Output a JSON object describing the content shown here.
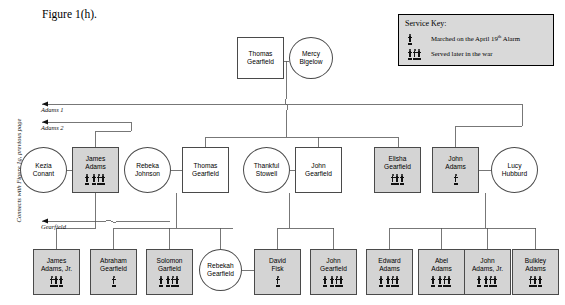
{
  "figure": {
    "caption": "Figure 1(h)."
  },
  "side_note": "Connects with Figure 1g, previous page",
  "service_key": {
    "title": "Service Key:",
    "entries": [
      {
        "icon": "single-soldier-icon",
        "label_prefix": "Marched on the April 19",
        "label_sup": "th",
        "label_suffix": " Alarm"
      },
      {
        "icon": "triple-soldier-icon",
        "label": "Served later in the war"
      }
    ]
  },
  "arrow_labels": [
    {
      "id": "adams1",
      "text": "Adams 1"
    },
    {
      "id": "adams2",
      "text": "Adams 2"
    },
    {
      "id": "gearfield",
      "text": "Gearfield"
    }
  ],
  "generations": {
    "gen1": [
      {
        "id": "thomas-gearfield-sr",
        "name": "Thomas\nGearfield",
        "sex": "male",
        "shaded": false,
        "service": []
      },
      {
        "id": "mercy-bigelow",
        "name": "Mercy\nBigelow",
        "sex": "female",
        "shaded": false,
        "service": []
      }
    ],
    "gen2": [
      {
        "id": "kezia-conant",
        "name": "Kezia\nConant",
        "sex": "female",
        "shaded": false,
        "service": []
      },
      {
        "id": "james-adams",
        "name": "James\nAdams",
        "sex": "male",
        "shaded": true,
        "service": [
          "single",
          "triple"
        ]
      },
      {
        "id": "rebeka-johnson",
        "name": "Rebeka\nJohnson",
        "sex": "female",
        "shaded": false,
        "service": []
      },
      {
        "id": "thomas-gearfield-jr",
        "name": "Thomas\nGearfield",
        "sex": "male",
        "shaded": false,
        "service": []
      },
      {
        "id": "thankful-stowell",
        "name": "Thankful\nStowell",
        "sex": "female",
        "shaded": false,
        "service": []
      },
      {
        "id": "john-gearfield",
        "name": "John\nGearfield",
        "sex": "male",
        "shaded": false,
        "service": []
      },
      {
        "id": "elisha-gearfield",
        "name": "Elisha\nGearfield",
        "sex": "male",
        "shaded": true,
        "service": [
          "triple"
        ]
      },
      {
        "id": "john-adams",
        "name": "John\nAdams",
        "sex": "male",
        "shaded": true,
        "service": [
          "single"
        ]
      },
      {
        "id": "lucy-hubburd",
        "name": "Lucy\nHubburd",
        "sex": "female",
        "shaded": false,
        "service": []
      }
    ],
    "gen3": [
      {
        "id": "james-adams-jr",
        "name": "James\nAdams, Jr.",
        "sex": "male",
        "shaded": true,
        "service": [
          "triple"
        ]
      },
      {
        "id": "abraham-gearfield",
        "name": "Abraham\nGearfield",
        "sex": "male",
        "shaded": true,
        "service": [
          "single"
        ]
      },
      {
        "id": "solomon-garfield",
        "name": "Solomon\nGarfield",
        "sex": "male",
        "shaded": true,
        "service": [
          "single",
          "triple"
        ]
      },
      {
        "id": "rebekah-gearfield",
        "name": "Rebekah\nGearfield",
        "sex": "female",
        "shaded": false,
        "service": []
      },
      {
        "id": "david-fisk",
        "name": "David\nFisk",
        "sex": "male",
        "shaded": true,
        "service": [
          "single"
        ]
      },
      {
        "id": "john-gearfield-2",
        "name": "John\nGearfield",
        "sex": "male",
        "shaded": true,
        "service": [
          "single",
          "triple"
        ]
      },
      {
        "id": "edward-adams",
        "name": "Edward\nAdams",
        "sex": "male",
        "shaded": true,
        "service": [
          "single",
          "triple"
        ]
      },
      {
        "id": "abel-adams",
        "name": "Abel\nAdams",
        "sex": "male",
        "shaded": true,
        "service": [
          "single",
          "triple"
        ]
      },
      {
        "id": "john-adams-jr",
        "name": "John\nAdams, Jr.",
        "sex": "male",
        "shaded": true,
        "service": [
          "single",
          "triple"
        ]
      },
      {
        "id": "bulkley-adams",
        "name": "Bulkley\nAdams",
        "sex": "male",
        "shaded": true,
        "service": [
          "triple"
        ]
      }
    ]
  },
  "layout": {
    "gen1": [
      {
        "x": 237,
        "y": 37,
        "w": 47,
        "h": 42
      },
      {
        "x": 289,
        "y": 37,
        "w": 44,
        "h": 42
      }
    ],
    "gen2": [
      {
        "x": 20,
        "y": 147,
        "w": 47,
        "h": 46
      },
      {
        "x": 72,
        "y": 147,
        "w": 47,
        "h": 46
      },
      {
        "x": 124,
        "y": 147,
        "w": 47,
        "h": 46
      },
      {
        "x": 182,
        "y": 147,
        "w": 47,
        "h": 46
      },
      {
        "x": 243,
        "y": 147,
        "w": 47,
        "h": 46
      },
      {
        "x": 295,
        "y": 147,
        "w": 47,
        "h": 46
      },
      {
        "x": 374,
        "y": 147,
        "w": 47,
        "h": 46
      },
      {
        "x": 432,
        "y": 147,
        "w": 47,
        "h": 46
      },
      {
        "x": 491,
        "y": 147,
        "w": 47,
        "h": 46
      }
    ],
    "gen3": [
      {
        "x": 33,
        "y": 249,
        "w": 47,
        "h": 46
      },
      {
        "x": 90,
        "y": 249,
        "w": 47,
        "h": 46
      },
      {
        "x": 146,
        "y": 249,
        "w": 47,
        "h": 46
      },
      {
        "x": 199,
        "y": 249,
        "w": 43,
        "h": 42
      },
      {
        "x": 254,
        "y": 249,
        "w": 47,
        "h": 46
      },
      {
        "x": 310,
        "y": 249,
        "w": 47,
        "h": 46
      },
      {
        "x": 366,
        "y": 249,
        "w": 47,
        "h": 46
      },
      {
        "x": 418,
        "y": 249,
        "w": 47,
        "h": 46
      },
      {
        "x": 464,
        "y": 249,
        "w": 47,
        "h": 46
      },
      {
        "x": 512,
        "y": 249,
        "w": 47,
        "h": 46
      }
    ]
  }
}
